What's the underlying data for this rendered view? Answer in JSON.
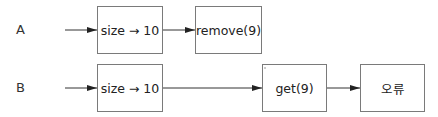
{
  "rows": [
    {
      "label": "A",
      "nodes": [
        {
          "text": "size → 10"
        },
        {
          "text": "remove(9)"
        }
      ]
    },
    {
      "label": "B",
      "nodes": [
        {
          "text": "size → 10"
        },
        {
          "text": "get(9)"
        },
        {
          "text": "오류"
        }
      ]
    }
  ],
  "colors": {
    "line": "#333333",
    "box_border": "#7a7a7a"
  }
}
